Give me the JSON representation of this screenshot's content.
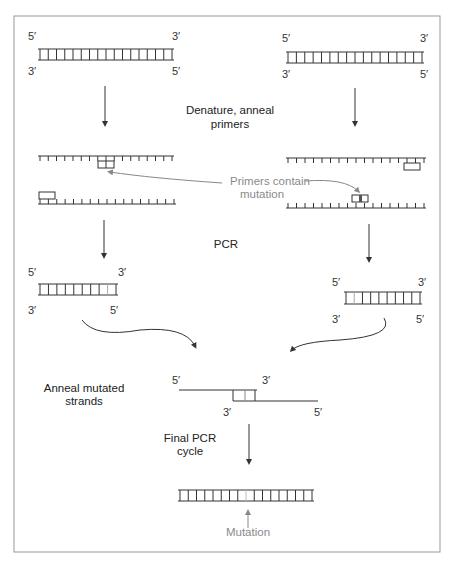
{
  "figure": {
    "steps": {
      "denature": [
        "Denature, anneal",
        "primers"
      ],
      "primers_note": [
        "Primers contain",
        "mutation"
      ],
      "pcr": "PCR",
      "anneal": [
        "Anneal mutated",
        "strands"
      ],
      "final": [
        "Final PCR",
        "cycle"
      ],
      "mutation": "Mutation"
    },
    "ends": {
      "five": "5′",
      "three": "3′"
    },
    "colors": {
      "ink": "#333333",
      "annotation": "#888888",
      "border": "#999999"
    }
  }
}
